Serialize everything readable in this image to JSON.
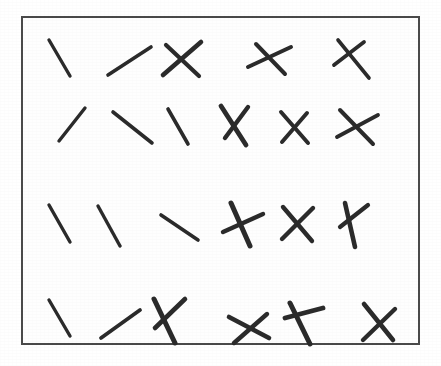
{
  "figure": {
    "background_color": "#ffffff"
  },
  "panel": {
    "border_color": "#4a4a4a",
    "border_width": 2,
    "fill_color": "#fefefe",
    "x": 21,
    "y": 16,
    "width": 399,
    "height": 329
  },
  "marks": {
    "ink_color": "#2b2b2b",
    "rows": 4,
    "columns": 6,
    "items": [
      {
        "id": "r1c1",
        "row": 1,
        "column": 1,
        "type": "single-slash",
        "strokes": [
          {
            "x1": 26,
            "y1": 22,
            "x2": 47,
            "y2": 58,
            "width": 3.4
          }
        ]
      },
      {
        "id": "r1c2",
        "row": 1,
        "column": 2,
        "type": "single-slash",
        "strokes": [
          {
            "x1": 85,
            "y1": 57,
            "x2": 128,
            "y2": 29,
            "width": 3.6
          }
        ]
      },
      {
        "id": "r1c3",
        "row": 1,
        "column": 3,
        "type": "cross",
        "strokes": [
          {
            "x1": 140,
            "y1": 57,
            "x2": 178,
            "y2": 24,
            "width": 4.6
          },
          {
            "x1": 143,
            "y1": 27,
            "x2": 176,
            "y2": 58,
            "width": 4.2
          }
        ]
      },
      {
        "id": "r1c4",
        "row": 1,
        "column": 4,
        "type": "cross",
        "strokes": [
          {
            "x1": 225,
            "y1": 49,
            "x2": 268,
            "y2": 29,
            "width": 4.0
          },
          {
            "x1": 233,
            "y1": 26,
            "x2": 262,
            "y2": 56,
            "width": 4.0
          }
        ]
      },
      {
        "id": "r1c5",
        "row": 1,
        "column": 5,
        "type": "cross",
        "strokes": [
          {
            "x1": 315,
            "y1": 22,
            "x2": 346,
            "y2": 60,
            "width": 3.6
          },
          {
            "x1": 341,
            "y1": 24,
            "x2": 311,
            "y2": 47,
            "width": 3.8
          }
        ]
      },
      {
        "id": "r1c6",
        "row": 1,
        "column": 6,
        "type": "empty",
        "strokes": []
      },
      {
        "id": "r2c1",
        "row": 2,
        "column": 1,
        "type": "single-slash",
        "strokes": [
          {
            "x1": 36,
            "y1": 123,
            "x2": 62,
            "y2": 90,
            "width": 3.4
          }
        ]
      },
      {
        "id": "r2c2",
        "row": 2,
        "column": 2,
        "type": "single-slash",
        "strokes": [
          {
            "x1": 90,
            "y1": 94,
            "x2": 129,
            "y2": 125,
            "width": 3.6
          }
        ]
      },
      {
        "id": "r2c3",
        "row": 2,
        "column": 3,
        "type": "single-slash",
        "strokes": [
          {
            "x1": 145,
            "y1": 91,
            "x2": 165,
            "y2": 126,
            "width": 3.6
          }
        ]
      },
      {
        "id": "r2c4",
        "row": 2,
        "column": 4,
        "type": "cross",
        "strokes": [
          {
            "x1": 198,
            "y1": 88,
            "x2": 223,
            "y2": 127,
            "width": 4.8
          },
          {
            "x1": 225,
            "y1": 89,
            "x2": 202,
            "y2": 120,
            "width": 4.4
          }
        ]
      },
      {
        "id": "r2c5",
        "row": 2,
        "column": 5,
        "type": "cross",
        "strokes": [
          {
            "x1": 258,
            "y1": 94,
            "x2": 285,
            "y2": 125,
            "width": 4.0
          },
          {
            "x1": 284,
            "y1": 95,
            "x2": 259,
            "y2": 124,
            "width": 4.0
          }
        ]
      },
      {
        "id": "r2c6",
        "row": 2,
        "column": 6,
        "type": "cross",
        "strokes": [
          {
            "x1": 317,
            "y1": 92,
            "x2": 350,
            "y2": 126,
            "width": 4.0
          },
          {
            "x1": 355,
            "y1": 97,
            "x2": 314,
            "y2": 119,
            "width": 3.8
          }
        ]
      },
      {
        "id": "r3c1",
        "row": 3,
        "column": 1,
        "type": "single-slash",
        "strokes": [
          {
            "x1": 26,
            "y1": 187,
            "x2": 47,
            "y2": 224,
            "width": 3.4
          }
        ]
      },
      {
        "id": "r3c2",
        "row": 3,
        "column": 2,
        "type": "single-slash",
        "strokes": [
          {
            "x1": 75,
            "y1": 188,
            "x2": 97,
            "y2": 228,
            "width": 3.4
          }
        ]
      },
      {
        "id": "r3c3",
        "row": 3,
        "column": 3,
        "type": "single-slash",
        "strokes": [
          {
            "x1": 138,
            "y1": 197,
            "x2": 175,
            "y2": 222,
            "width": 3.6
          }
        ]
      },
      {
        "id": "r3c4",
        "row": 3,
        "column": 4,
        "type": "cross",
        "strokes": [
          {
            "x1": 208,
            "y1": 185,
            "x2": 227,
            "y2": 228,
            "width": 5.0
          },
          {
            "x1": 240,
            "y1": 196,
            "x2": 200,
            "y2": 214,
            "width": 4.4
          }
        ]
      },
      {
        "id": "r3c5",
        "row": 3,
        "column": 5,
        "type": "cross",
        "strokes": [
          {
            "x1": 260,
            "y1": 189,
            "x2": 289,
            "y2": 223,
            "width": 4.4
          },
          {
            "x1": 290,
            "y1": 190,
            "x2": 259,
            "y2": 221,
            "width": 4.4
          }
        ]
      },
      {
        "id": "r3c6",
        "row": 3,
        "column": 6,
        "type": "cross",
        "strokes": [
          {
            "x1": 322,
            "y1": 185,
            "x2": 332,
            "y2": 229,
            "width": 4.6
          },
          {
            "x1": 345,
            "y1": 187,
            "x2": 317,
            "y2": 209,
            "width": 4.2
          }
        ]
      },
      {
        "id": "r4c1",
        "row": 4,
        "column": 1,
        "type": "single-slash",
        "strokes": [
          {
            "x1": 26,
            "y1": 282,
            "x2": 47,
            "y2": 318,
            "width": 3.4
          }
        ]
      },
      {
        "id": "r4c2",
        "row": 4,
        "column": 2,
        "type": "single-slash",
        "strokes": [
          {
            "x1": 78,
            "y1": 320,
            "x2": 117,
            "y2": 292,
            "width": 3.8
          }
        ]
      },
      {
        "id": "r4c3",
        "row": 4,
        "column": 3,
        "type": "cross",
        "strokes": [
          {
            "x1": 131,
            "y1": 281,
            "x2": 152,
            "y2": 325,
            "width": 5.0
          },
          {
            "x1": 162,
            "y1": 281,
            "x2": 132,
            "y2": 310,
            "width": 4.6
          }
        ]
      },
      {
        "id": "r4c4",
        "row": 4,
        "column": 4,
        "type": "cross",
        "strokes": [
          {
            "x1": 206,
            "y1": 299,
            "x2": 246,
            "y2": 320,
            "width": 4.6
          },
          {
            "x1": 244,
            "y1": 296,
            "x2": 211,
            "y2": 325,
            "width": 4.4
          }
        ]
      },
      {
        "id": "r4c5",
        "row": 4,
        "column": 5,
        "type": "cross",
        "strokes": [
          {
            "x1": 267,
            "y1": 285,
            "x2": 287,
            "y2": 326,
            "width": 5.0
          },
          {
            "x1": 300,
            "y1": 290,
            "x2": 262,
            "y2": 300,
            "width": 4.8
          }
        ]
      },
      {
        "id": "r4c6",
        "row": 4,
        "column": 6,
        "type": "cross",
        "strokes": [
          {
            "x1": 341,
            "y1": 286,
            "x2": 370,
            "y2": 322,
            "width": 4.6
          },
          {
            "x1": 372,
            "y1": 291,
            "x2": 340,
            "y2": 322,
            "width": 4.4
          }
        ]
      }
    ]
  }
}
